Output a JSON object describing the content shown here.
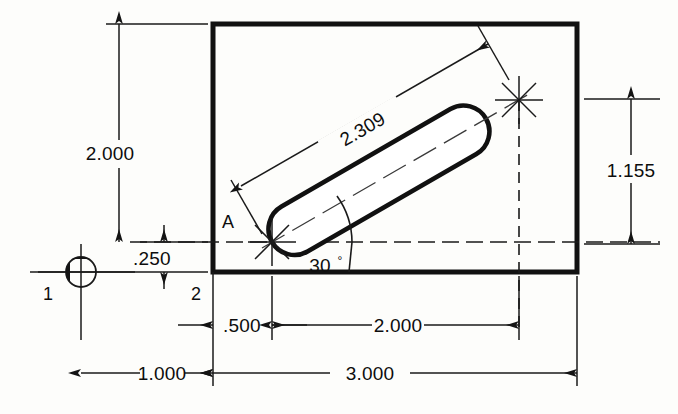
{
  "drawing": {
    "title": "Angled slot dimensioned drawing",
    "colors": {
      "ink": "#111111",
      "paper": "#fdfdfb",
      "thin_line": "#1a1a1a"
    },
    "part": {
      "shape_name": "rectangular-plate",
      "feature_name": "angled-slot"
    },
    "dimensions": {
      "height_overall": "2.000",
      "slot_length": "2.309",
      "slot_rise": "1.155",
      "slot_angle": "30",
      "degree_symbol": "°",
      "bottom_offset": ".250",
      "slot_x_offset": ".500",
      "slot_run": "2.000",
      "datum_offset": "1.000",
      "width_overall": "3.000"
    },
    "labels": {
      "datum_one": "1",
      "datum_two": "2",
      "point_a": "A"
    }
  }
}
